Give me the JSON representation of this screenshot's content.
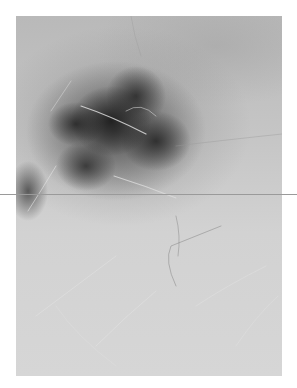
{
  "image": {
    "subject": "dermoscopy photograph of pigmented skin lesion",
    "mode": "grayscale",
    "colors": {
      "background": "#ffffff",
      "skin": "#d2d2d2",
      "lesion_dark": "#1e1e1e",
      "overlay_line": "#9a9a9a"
    }
  }
}
